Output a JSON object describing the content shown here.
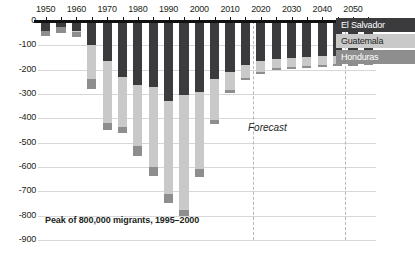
{
  "chart_data": {
    "type": "bar",
    "stacked": true,
    "orientation": "vertical",
    "title": "",
    "subtitle": "",
    "xlabel": "",
    "ylabel": "",
    "ylim": [
      -900,
      0
    ],
    "yticks": [
      0,
      -100,
      -200,
      -300,
      -400,
      -500,
      -600,
      -700,
      -800,
      -900
    ],
    "ytick_labels": [
      "0",
      "-100",
      "-200",
      "-300",
      "-400",
      "-500",
      "-600",
      "-700",
      "-800",
      "-900"
    ],
    "xtick_labels": [
      "1950",
      "1960",
      "1970",
      "1980",
      "1990",
      "2000",
      "2010",
      "2020",
      "2030",
      "2040",
      "2050"
    ],
    "grid": true,
    "legend_position": "right-top",
    "categories": [
      "1950",
      "1955",
      "1960",
      "1965",
      "1970",
      "1975",
      "1980",
      "1985",
      "1990",
      "1995",
      "2000",
      "2005",
      "2010",
      "2015",
      "2020",
      "2025",
      "2030",
      "2035",
      "2040",
      "2045",
      "2050",
      "2055"
    ],
    "series": [
      {
        "name": "El Salvador",
        "color": "#3b3b3d",
        "values": [
          -40,
          -25,
          -40,
          -100,
          -165,
          -230,
          -265,
          -270,
          -330,
          -305,
          -290,
          -240,
          -210,
          -180,
          -165,
          -155,
          -150,
          -148,
          -145,
          -143,
          -142,
          -140
        ]
      },
      {
        "name": "Guatemala",
        "color": "#c9c9c9",
        "values": [
          0,
          0,
          -5,
          -140,
          -255,
          -205,
          -250,
          -330,
          -380,
          -470,
          -320,
          -165,
          -75,
          -55,
          -45,
          -40,
          -38,
          -36,
          -35,
          -34,
          -33,
          -32
        ]
      },
      {
        "name": "Honduras",
        "color": "#8e8e8e",
        "values": [
          -20,
          -25,
          -20,
          -40,
          -30,
          -25,
          -40,
          -35,
          -40,
          -25,
          -30,
          -20,
          -10,
          -8,
          -8,
          -8,
          -8,
          -8,
          -8,
          -8,
          -8,
          -8
        ]
      }
    ],
    "totals": [
      -60,
      -50,
      -65,
      -280,
      -450,
      -460,
      -555,
      -635,
      -750,
      -800,
      -640,
      -425,
      -295,
      -243,
      -218,
      -203,
      -196,
      -192,
      -188,
      -185,
      -183,
      -180
    ],
    "annotations": [
      {
        "name": "peak-annotation",
        "text": "Peak of 800,000 migrants, 1995–2000"
      },
      {
        "name": "forecast-label",
        "text": "Forecast"
      }
    ],
    "forecast_region": {
      "start": "2020",
      "end": "2050"
    }
  },
  "legend": {
    "items": [
      {
        "label": "El Salvador",
        "key": "el-salvador"
      },
      {
        "label": "Guatemala",
        "key": "guatemala"
      },
      {
        "label": "Honduras",
        "key": "honduras"
      }
    ]
  },
  "colors": {
    "el_salvador": "#3b3b3d",
    "guatemala": "#c9c9c9",
    "honduras": "#8e8e8e",
    "axis": "#111111",
    "grid": "#d7d7d7",
    "forecast_line": "#b6b6b6",
    "background": "#ffffff"
  }
}
